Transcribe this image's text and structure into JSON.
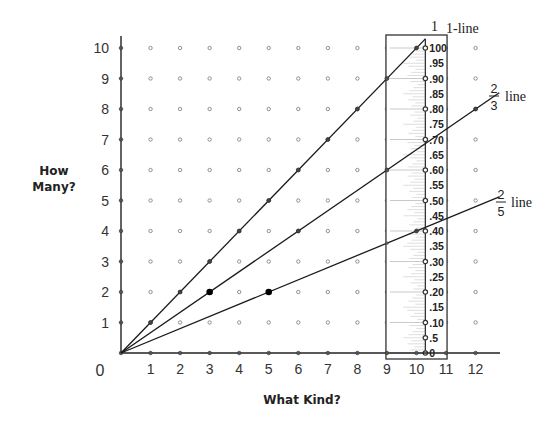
{
  "chart_data": {
    "type": "line",
    "title": "",
    "xlabel": "What Kind?",
    "ylabel": "How Many?",
    "xlim": [
      0,
      12
    ],
    "ylim": [
      0,
      10
    ],
    "x_ticks": [
      "0",
      "1",
      "2",
      "3",
      "4",
      "5",
      "6",
      "7",
      "8",
      "9",
      "10",
      "11",
      "12"
    ],
    "y_ticks": [
      "1",
      "2",
      "3",
      "4",
      "5",
      "6",
      "7",
      "8",
      "9",
      "10"
    ],
    "grid": "dot lattice at integer points",
    "series": [
      {
        "name": "1-line",
        "label": "1-line",
        "label_prefix": "1",
        "slope": 1,
        "from": [
          0,
          0
        ],
        "to": [
          10.3,
          10.3
        ]
      },
      {
        "name": "2/3 line",
        "label_num": "2",
        "label_den": "3",
        "label_text": "line",
        "slope": 0.6667,
        "from": [
          0,
          0
        ],
        "to": [
          12.8,
          8.53
        ]
      },
      {
        "name": "2/5 line",
        "label_num": "2",
        "label_den": "5",
        "label_text": "line",
        "slope": 0.4,
        "from": [
          0,
          0
        ],
        "to": [
          12.8,
          5.12
        ]
      }
    ],
    "highlighted_points": [
      {
        "x": 3,
        "y": 2,
        "series": "2/3 line"
      },
      {
        "x": 5,
        "y": 2,
        "series": "2/5 line"
      }
    ],
    "ruler": {
      "x_position": 10.3,
      "box_x_range": [
        9,
        11
      ],
      "labels": [
        "0",
        ".5",
        ".10",
        ".15",
        ".20",
        ".25",
        ".30",
        ".35",
        ".40",
        ".45",
        ".50",
        ".55",
        ".60",
        ".65",
        ".70",
        ".75",
        ".80",
        ".85",
        ".90",
        ".95",
        "100"
      ],
      "dotted_values": [
        0,
        0.05,
        0.1,
        0.2,
        0.3,
        0.4,
        0.5,
        0.6,
        0.7,
        0.8,
        0.9,
        1.0
      ]
    },
    "legend": "inline labels at line ends"
  },
  "labels": {
    "y_axis_title_line1": "How",
    "y_axis_title_line2": "Many?",
    "x_axis_title": "What Kind?",
    "origin": "0"
  }
}
